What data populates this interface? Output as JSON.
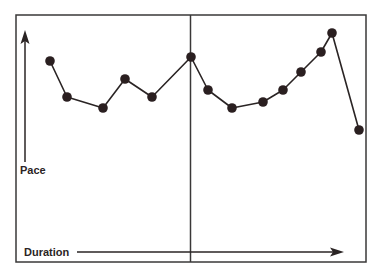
{
  "chart_data": {
    "type": "line",
    "title": "",
    "xlabel": "Duration",
    "ylabel": "Pace",
    "grid": false,
    "legend": null,
    "divider": "vertical line at the 7th point (midpoint of sequence)",
    "x": [
      1,
      2,
      3,
      4,
      5,
      6,
      7,
      8,
      9,
      10,
      11,
      12,
      13,
      14
    ],
    "values": [
      7.0,
      5.5,
      5.0,
      6.3,
      5.5,
      7.2,
      5.9,
      5.0,
      5.3,
      5.9,
      6.6,
      7.5,
      8.4,
      3.9
    ],
    "ylim": [
      0,
      10
    ]
  },
  "labels": {
    "y_axis": "Pace",
    "x_axis": "Duration"
  },
  "colors": {
    "line": "#2a2424",
    "marker": "#2a1f20",
    "frame": "#3a3838",
    "background": "#ffffff"
  },
  "points_px": [
    [
      50,
      61
    ],
    [
      67,
      97
    ],
    [
      103,
      108
    ],
    [
      125,
      79
    ],
    [
      152,
      97
    ],
    [
      191,
      57
    ],
    [
      208,
      90
    ],
    [
      232,
      108
    ],
    [
      263,
      102
    ],
    [
      283,
      90
    ],
    [
      301,
      72
    ],
    [
      321,
      52
    ],
    [
      332,
      33
    ],
    [
      359,
      130
    ]
  ]
}
